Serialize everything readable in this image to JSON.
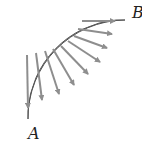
{
  "figure": {
    "labels": {
      "A": "A",
      "B": "B"
    },
    "colors": {
      "beam_fill": "#a8a8a8",
      "beam_stroke": "#555555",
      "arrow": "#8e8e8e",
      "text": "#222222"
    },
    "arrow_count": 9
  }
}
